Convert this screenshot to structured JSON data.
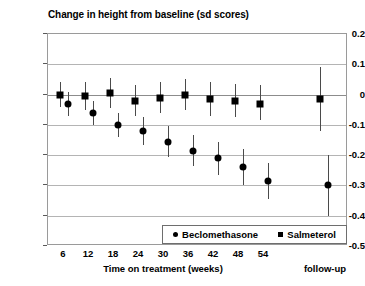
{
  "chart_data": {
    "type": "scatter",
    "title": "Change in height from baseline (sd scores)",
    "xlabel": "Time on treatment (weeks)",
    "ylabel": "",
    "ylim": [
      -0.5,
      0.2
    ],
    "yticks": [
      0.2,
      0.1,
      0,
      -0.1,
      -0.2,
      -0.3,
      -0.4,
      -0.5
    ],
    "ytick_labels": [
      "0.2",
      "0.1",
      "0",
      "-0.1",
      "-0.2",
      "-0.3",
      "-0.4",
      "-0.5"
    ],
    "categories": [
      "6",
      "12",
      "18",
      "24",
      "30",
      "36",
      "42",
      "48",
      "54",
      "follow-up"
    ],
    "xtick_labels": [
      "6",
      "12",
      "18",
      "24",
      "30",
      "36",
      "42",
      "48",
      "54"
    ],
    "followup_label": "follow-up",
    "grid": true,
    "legend_position": "bottom-right",
    "series": [
      {
        "name": "Beclomethasone",
        "marker": "circle",
        "values": [
          -0.03,
          -0.06,
          -0.1,
          -0.12,
          -0.155,
          -0.185,
          -0.21,
          -0.24,
          -0.285,
          -0.3
        ],
        "ci_low": [
          -0.07,
          -0.1,
          -0.14,
          -0.165,
          -0.205,
          -0.235,
          -0.265,
          -0.3,
          -0.345,
          -0.4
        ],
        "ci_high": [
          0.01,
          -0.02,
          -0.06,
          -0.075,
          -0.105,
          -0.135,
          -0.155,
          -0.18,
          -0.225,
          -0.2
        ]
      },
      {
        "name": "Salmeterol",
        "marker": "square",
        "values": [
          0.0,
          -0.005,
          0.005,
          -0.02,
          -0.01,
          0.0,
          -0.015,
          -0.02,
          -0.03,
          -0.015
        ],
        "ci_low": [
          -0.04,
          -0.05,
          -0.045,
          -0.07,
          -0.06,
          -0.05,
          -0.07,
          -0.075,
          -0.085,
          -0.12
        ],
        "ci_high": [
          0.04,
          0.04,
          0.055,
          0.03,
          0.04,
          0.05,
          0.04,
          0.035,
          0.03,
          0.09
        ]
      }
    ]
  },
  "legend": {
    "entries": [
      {
        "label": "Beclomethasone",
        "marker": "circle"
      },
      {
        "label": "Salmeterol",
        "marker": "square"
      }
    ]
  }
}
